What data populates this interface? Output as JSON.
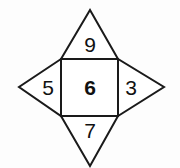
{
  "figure": {
    "name": "star-polygon-number-figure",
    "stroke_color": "#1a1a1a",
    "fill_color": "#ffffff",
    "background_color": "#fdfdfd",
    "stroke_width": 2,
    "geometry": {
      "square": {
        "left": 61,
        "top": 59,
        "right": 118,
        "bottom": 116
      },
      "top_apex": {
        "x": 90,
        "y": 10
      },
      "left_apex": {
        "x": 19,
        "y": 87
      },
      "right_apex": {
        "x": 164,
        "y": 87
      },
      "bottom_apex": {
        "x": 90,
        "y": 166
      }
    },
    "regions": [
      {
        "id": "top-triangle",
        "position": "top",
        "value": "9",
        "bold": false
      },
      {
        "id": "left-triangle",
        "position": "left",
        "value": "5",
        "bold": false
      },
      {
        "id": "center-square",
        "position": "center",
        "value": "6",
        "bold": true
      },
      {
        "id": "right-triangle",
        "position": "right",
        "value": "3",
        "bold": false
      },
      {
        "id": "bottom-triangle",
        "position": "bottom",
        "value": "7",
        "bold": false
      }
    ],
    "labels": {
      "top": "9",
      "left": "5",
      "center": "6",
      "right": "3",
      "bottom": "7"
    }
  }
}
